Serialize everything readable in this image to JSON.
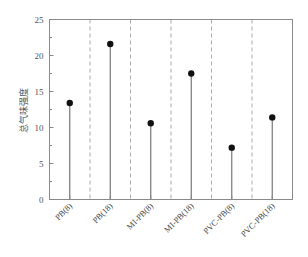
{
  "chart_data": {
    "type": "stem",
    "title": "",
    "xlabel": "",
    "ylabel": "总气味强度",
    "ylim": [
      0,
      25
    ],
    "yticks": [
      0,
      5,
      10,
      15,
      20,
      25
    ],
    "yticks_minor_step": 2.5,
    "grid": false,
    "group_separators": "dashed vertical lines between categories",
    "categories": [
      "PB(8)",
      "PB(18)",
      "MI-PB(8)",
      "MI-PB(18)",
      "PVC-PB(8)",
      "PVC-PB(18)"
    ],
    "values": [
      13.4,
      21.6,
      10.6,
      17.5,
      7.2,
      11.4
    ],
    "marker": "filled circle",
    "colors": {
      "marker": "#111111",
      "stem": "#777777",
      "axis": "#888888",
      "separator": "#aaaaaa"
    }
  },
  "axis": {
    "tick_labels": [
      "0",
      "5",
      "10",
      "15",
      "20",
      "25"
    ]
  }
}
